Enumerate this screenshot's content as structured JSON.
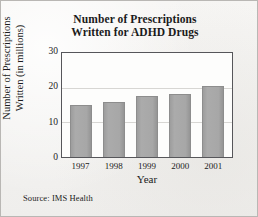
{
  "figure": {
    "source_note": "Source: IMS Health",
    "background_color": "#f3f2f0",
    "border_color": "#b9b7b4",
    "bar_color": "#a7a7a7",
    "frame_color": "#56565a",
    "gridline_color": "#d7d6d3"
  },
  "chart_data": {
    "type": "bar",
    "title": "Number of Prescriptions Written for ADHD Drugs",
    "title_lines": [
      "Number of Prescriptions",
      "Written for ADHD Drugs"
    ],
    "xlabel": "Year",
    "ylabel": "Number of Prescriptions Written (in millions)",
    "ylabel_lines": [
      "Number of Prescriptions",
      "Written (in millions)"
    ],
    "categories": [
      "1997",
      "1998",
      "1999",
      "2000",
      "2001"
    ],
    "values": [
      15,
      16,
      17.7,
      18.3,
      20.6
    ],
    "ylim": [
      0,
      30
    ],
    "yticks": [
      "0",
      "10",
      "20",
      "30"
    ],
    "ytick_values": [
      0,
      10,
      20,
      30
    ],
    "grid": "horizontal gridlines at 10 and 20",
    "legend": "none"
  }
}
